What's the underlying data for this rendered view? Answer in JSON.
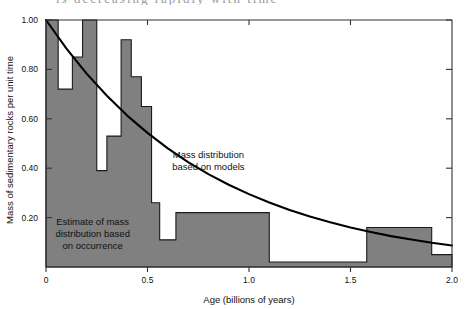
{
  "figure": {
    "scan_artifact_text": "is decreasing rapidly with time",
    "colors": {
      "bar_fill": "#808080",
      "bar_stroke": "#1a1a1a",
      "curve": "#000000",
      "axis": "#333333",
      "text": "#111111",
      "background": "#ffffff"
    }
  },
  "chart_data": {
    "type": "bar",
    "title": "",
    "xlabel": "Age (billions of years)",
    "ylabel": "Mass of sedimentary rocks per unit time",
    "xlim": [
      0,
      2.0
    ],
    "ylim": [
      0,
      1.0
    ],
    "xticks": [
      0,
      0.5,
      1.0,
      1.5,
      2.0
    ],
    "xtick_labels": [
      "0",
      "0.5",
      "1.0",
      "1.5",
      "2.0"
    ],
    "yticks": [
      0.2,
      0.4,
      0.6,
      0.8,
      1.0
    ],
    "ytick_labels": [
      "0.20",
      "0.40",
      "0.60",
      "0.80",
      "1.00"
    ],
    "grid": false,
    "legend_position": "none",
    "series": [
      {
        "name": "Estimate of mass distribution based on occurrence",
        "type": "bar",
        "bins": [
          {
            "x0": 0.0,
            "x1": 0.06,
            "value": 1.0
          },
          {
            "x0": 0.06,
            "x1": 0.13,
            "value": 0.72
          },
          {
            "x0": 0.13,
            "x1": 0.18,
            "value": 0.85
          },
          {
            "x0": 0.18,
            "x1": 0.25,
            "value": 1.0
          },
          {
            "x0": 0.25,
            "x1": 0.3,
            "value": 0.39
          },
          {
            "x0": 0.3,
            "x1": 0.37,
            "value": 0.53
          },
          {
            "x0": 0.37,
            "x1": 0.42,
            "value": 0.92
          },
          {
            "x0": 0.42,
            "x1": 0.47,
            "value": 0.77
          },
          {
            "x0": 0.47,
            "x1": 0.52,
            "value": 0.65
          },
          {
            "x0": 0.52,
            "x1": 0.56,
            "value": 0.26
          },
          {
            "x0": 0.56,
            "x1": 0.64,
            "value": 0.11
          },
          {
            "x0": 0.64,
            "x1": 1.1,
            "value": 0.22
          },
          {
            "x0": 1.1,
            "x1": 1.58,
            "value": 0.02
          },
          {
            "x0": 1.58,
            "x1": 1.9,
            "value": 0.16
          },
          {
            "x0": 1.9,
            "x1": 2.0,
            "value": 0.05
          }
        ]
      },
      {
        "name": "Mass distribution based on models",
        "type": "line",
        "description": "Exponential decay curve from 1.00 at age 0",
        "points": [
          {
            "x": 0.0,
            "y": 1.0
          },
          {
            "x": 0.1,
            "y": 0.885
          },
          {
            "x": 0.2,
            "y": 0.783
          },
          {
            "x": 0.3,
            "y": 0.693
          },
          {
            "x": 0.4,
            "y": 0.613
          },
          {
            "x": 0.5,
            "y": 0.543
          },
          {
            "x": 0.6,
            "y": 0.48
          },
          {
            "x": 0.7,
            "y": 0.425
          },
          {
            "x": 0.8,
            "y": 0.376
          },
          {
            "x": 0.9,
            "y": 0.333
          },
          {
            "x": 1.0,
            "y": 0.295
          },
          {
            "x": 1.1,
            "y": 0.261
          },
          {
            "x": 1.2,
            "y": 0.231
          },
          {
            "x": 1.3,
            "y": 0.204
          },
          {
            "x": 1.4,
            "y": 0.181
          },
          {
            "x": 1.5,
            "y": 0.16
          },
          {
            "x": 1.6,
            "y": 0.142
          },
          {
            "x": 1.7,
            "y": 0.125
          },
          {
            "x": 1.8,
            "y": 0.111
          },
          {
            "x": 1.9,
            "y": 0.098
          },
          {
            "x": 2.0,
            "y": 0.087
          }
        ]
      }
    ],
    "annotations": [
      {
        "id": "model-label",
        "lines": [
          "Mass distribution",
          "based on models"
        ],
        "x": 0.8,
        "y": 0.44
      },
      {
        "id": "estimate-label",
        "lines": [
          "Estimate of mass",
          "distribution based",
          "on occurrence"
        ],
        "x": 0.23,
        "y": 0.17
      }
    ]
  }
}
